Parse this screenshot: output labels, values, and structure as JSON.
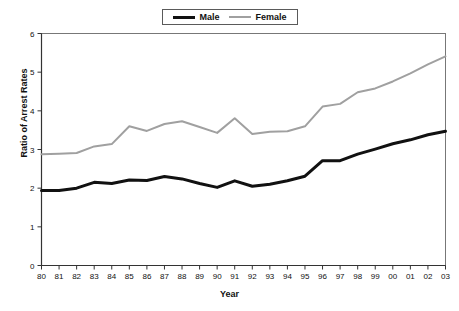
{
  "chart_data": {
    "type": "line",
    "title": "",
    "xlabel": "Year",
    "ylabel": "Ratio of Arrest Rates",
    "x": [
      "80",
      "81",
      "82",
      "83",
      "84",
      "85",
      "86",
      "87",
      "88",
      "89",
      "90",
      "91",
      "92",
      "93",
      "94",
      "95",
      "96",
      "97",
      "98",
      "99",
      "00",
      "01",
      "02",
      "03"
    ],
    "xtick_labels": [
      "80",
      "81",
      "82",
      "83",
      "84",
      "85",
      "86",
      "87",
      "88",
      "89",
      "90",
      "91",
      "92",
      "93",
      "94",
      "95",
      "96",
      "97",
      "98",
      "99",
      "00",
      "01",
      "02",
      "03"
    ],
    "ytick_labels": [
      "0",
      "1",
      "2",
      "3",
      "4",
      "5",
      "6"
    ],
    "yticks": [
      0,
      1,
      2,
      3,
      4,
      5,
      6
    ],
    "ylim": [
      0,
      6
    ],
    "xlim": [
      1980,
      2003
    ],
    "grid": false,
    "legend_position": "top-center",
    "series": [
      {
        "name": "Male",
        "color": "#111111",
        "width": 3,
        "values": [
          1.94,
          1.94,
          2.0,
          2.15,
          2.12,
          2.21,
          2.2,
          2.3,
          2.24,
          2.12,
          2.02,
          2.19,
          2.05,
          2.1,
          2.19,
          2.31,
          2.71,
          2.71,
          2.88,
          3.01,
          3.15,
          3.25,
          3.38,
          3.47
        ]
      },
      {
        "name": "Female",
        "color": "#a0a0a0",
        "width": 2,
        "values": [
          2.88,
          2.89,
          2.91,
          3.08,
          3.14,
          3.6,
          3.48,
          3.66,
          3.73,
          3.58,
          3.43,
          3.81,
          3.4,
          3.46,
          3.47,
          3.6,
          4.11,
          4.18,
          4.48,
          4.58,
          4.76,
          4.97,
          5.2,
          5.41
        ]
      }
    ]
  },
  "legend": {
    "items": [
      {
        "label": "Male"
      },
      {
        "label": "Female"
      }
    ]
  },
  "axes": {
    "y_title": "Ratio of Arrest Rates",
    "x_title": "Year"
  }
}
